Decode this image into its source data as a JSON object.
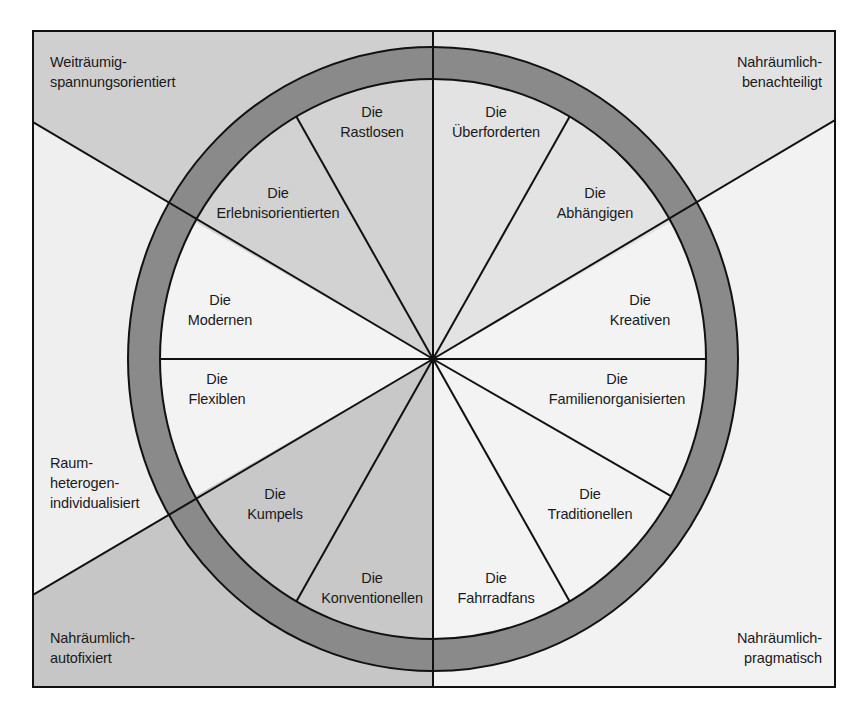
{
  "colors": {
    "frame": "#111111",
    "ring": "#8a8a8a",
    "bg_top_left": "#cfcfcf",
    "bg_top_right": "#e2e2e2",
    "bg_mid_left": "#efefef",
    "bg_bottom_left": "#c6c6c6",
    "bg_right": "#f2f2f2",
    "wedge_gray": "#d2d2d2",
    "wedge_light": "#e3e3e3",
    "wedge_white": "#f3f3f3",
    "wedge_dark": "#c8c8c8"
  },
  "outer_labels": {
    "top_left": [
      "Weiträumig-",
      "spannungsorientiert"
    ],
    "top_right": [
      "Nahräumlich-",
      "benachteiligt"
    ],
    "middle_left": [
      "Raum-",
      "heterogen-",
      "individualisiert"
    ],
    "bottom_left": [
      "Nahräumlich-",
      "autofixiert"
    ],
    "bottom_right": [
      "Nahräumlich-",
      "pragmatisch"
    ]
  },
  "segments": [
    {
      "line1": "Die",
      "line2": "Rastlosen"
    },
    {
      "line1": "Die",
      "line2": "Überforderten"
    },
    {
      "line1": "Die",
      "line2": "Erlebnisorientierten"
    },
    {
      "line1": "Die",
      "line2": "Abhängigen"
    },
    {
      "line1": "Die",
      "line2": "Modernen"
    },
    {
      "line1": "Die",
      "line2": "Kreativen"
    },
    {
      "line1": "Die",
      "line2": "Flexiblen"
    },
    {
      "line1": "Die",
      "line2": "Familienorganisierten"
    },
    {
      "line1": "Die",
      "line2": "Kumpels"
    },
    {
      "line1": "Die",
      "line2": "Traditionellen"
    },
    {
      "line1": "Die",
      "line2": "Konventionellen"
    },
    {
      "line1": "Die",
      "line2": "Fahrradfans"
    }
  ]
}
